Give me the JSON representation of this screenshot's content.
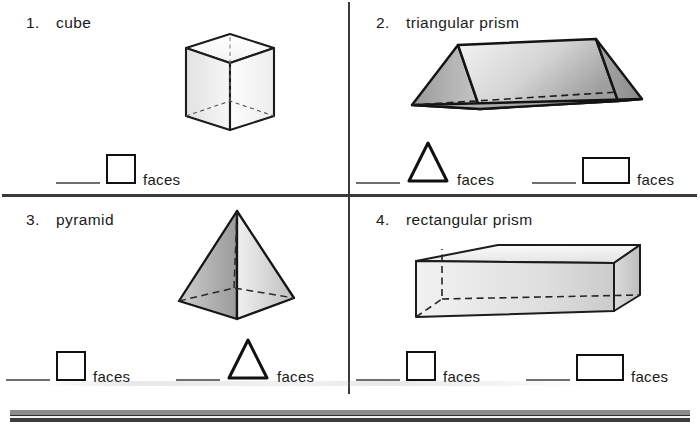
{
  "worksheet": {
    "problems": [
      {
        "number": "1.",
        "label": "cube",
        "figure_name": "cube-figure",
        "answers": [
          {
            "shape": "square",
            "unit": "faces"
          }
        ]
      },
      {
        "number": "2.",
        "label": "triangular prism",
        "figure_name": "triangular-prism-figure",
        "answers": [
          {
            "shape": "triangle",
            "unit": "faces"
          },
          {
            "shape": "rectangle",
            "unit": "faces"
          }
        ]
      },
      {
        "number": "3.",
        "label": "pyramid",
        "figure_name": "pyramid-figure",
        "answers": [
          {
            "shape": "square",
            "unit": "faces"
          },
          {
            "shape": "triangle",
            "unit": "faces"
          }
        ]
      },
      {
        "number": "4.",
        "label": "rectangular prism",
        "figure_name": "rectangular-prism-figure",
        "answers": [
          {
            "shape": "square",
            "unit": "faces"
          },
          {
            "shape": "rectangle",
            "unit": "faces"
          }
        ]
      }
    ]
  },
  "colors": {
    "ink": "#111111",
    "rule": "#3a3a3a",
    "blank_line": "#6f6f6f",
    "shade_dark": "#8e8e8e",
    "shade_mid": "#b5b5b5",
    "shade_light": "#ededed",
    "band_light": "#8c8c8c",
    "band_dark": "#3d3d3d"
  }
}
